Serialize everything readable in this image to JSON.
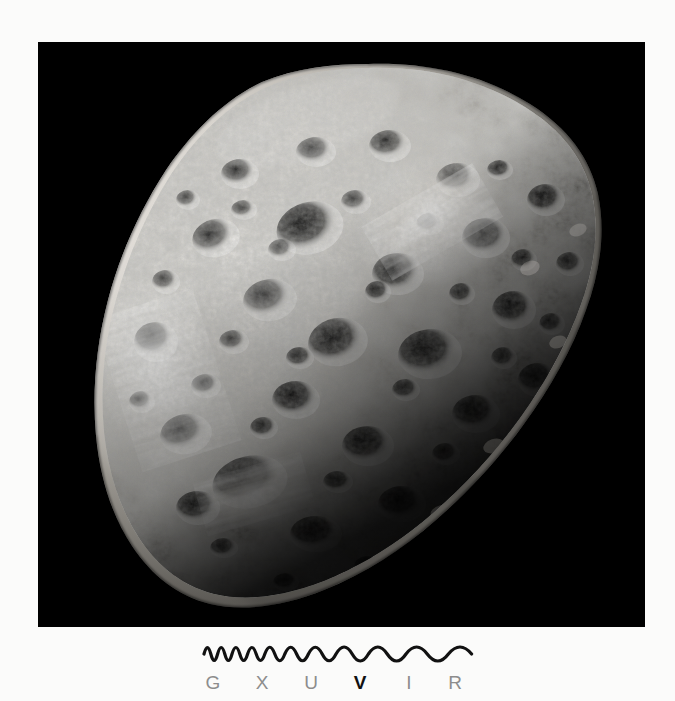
{
  "page": {
    "background_color": "#fbfbfa",
    "width": 675,
    "height": 701
  },
  "image_plate": {
    "name": "hyperion-photograph",
    "alt": "Saturn's moon Hyperion",
    "background_color": "#000000",
    "subject": "Hyperion",
    "body_description": "Irregular sponge-like heavily cratered icy moon, lit from upper left, terminator shadow on lower right",
    "bounds": {
      "x": 38,
      "y": 42,
      "width": 607,
      "height": 585
    },
    "lighting": {
      "direction": "upper-left",
      "highlight_color": "#f2f0ec",
      "midtone_color": "#9a9790",
      "shadow_color": "#141414"
    }
  },
  "spectrum": {
    "name": "electromagnetic-spectrum-key",
    "wave_color": "#111111",
    "label_color": "#8d8d8d",
    "accent_color": "#111111",
    "bands": [
      {
        "key": "G",
        "label": "G",
        "name": "gamma-ray",
        "highlighted": false,
        "x": 20
      },
      {
        "key": "X",
        "label": "X",
        "name": "x-ray",
        "highlighted": false,
        "x": 69
      },
      {
        "key": "U",
        "label": "U",
        "name": "ultraviolet",
        "highlighted": false,
        "x": 118
      },
      {
        "key": "V",
        "label": "V",
        "name": "visible",
        "highlighted": true,
        "x": 167
      },
      {
        "key": "I",
        "label": "I",
        "name": "infrared",
        "highlighted": false,
        "x": 216
      },
      {
        "key": "R",
        "label": "R",
        "name": "radio",
        "highlighted": false,
        "x": 262
      }
    ],
    "wave": {
      "description": "Sine wave with wavelength increasing from left (gamma) to right (radio)",
      "stroke_width": 3.2,
      "amplitude": 13,
      "cycles": 13
    }
  }
}
